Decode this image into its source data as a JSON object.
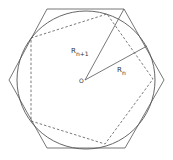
{
  "diagram": {
    "labels": {
      "outer_radius": "R",
      "outer_radius_sub": "n+1",
      "inner_radius": "R",
      "inner_radius_sub": "n",
      "center": "O"
    },
    "colors": {
      "stroke": "#555555",
      "background": "#ffffff"
    }
  }
}
